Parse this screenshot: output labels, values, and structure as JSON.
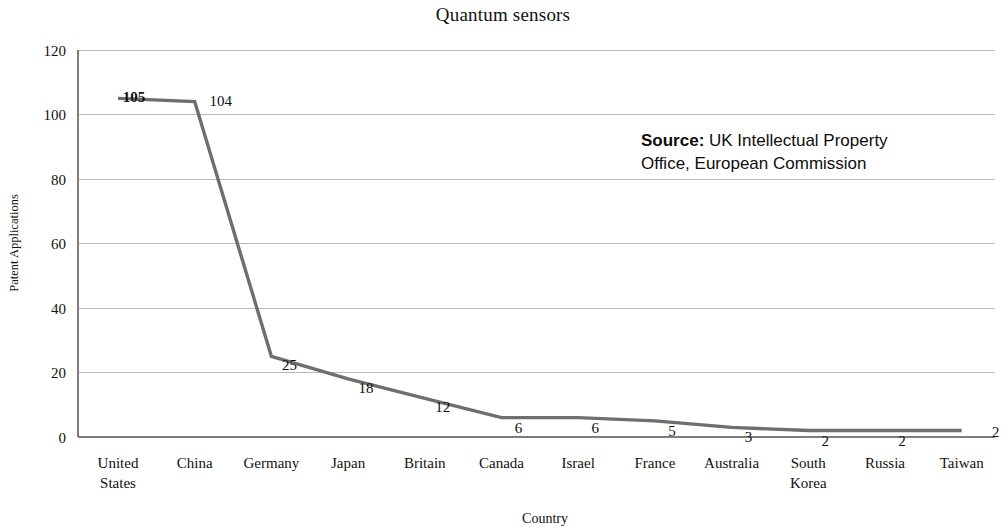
{
  "chart_data": {
    "type": "line",
    "title": "Quantum sensors",
    "xlabel": "Country",
    "ylabel": "Patent Applications",
    "categories": [
      "United States",
      "China",
      "Germany",
      "Japan",
      "Britain",
      "Canada",
      "Israel",
      "France",
      "Australia",
      "South Korea",
      "Russia",
      "Taiwan"
    ],
    "values": [
      105,
      104,
      25,
      18,
      12,
      6,
      6,
      5,
      3,
      2,
      2,
      2
    ],
    "data_labels": [
      "105",
      "104",
      "25",
      "18",
      "12",
      "6",
      "6",
      "5",
      "3",
      "2",
      "2",
      "2"
    ],
    "ylim": [
      0,
      120
    ],
    "ytick_labels": [
      "0",
      "20",
      "40",
      "60",
      "80",
      "100",
      "120"
    ],
    "yticks": [
      0,
      20,
      40,
      60,
      80,
      100,
      120
    ],
    "grid": true,
    "legend": "none",
    "series_color": "#6e6e6e",
    "gridline_color": "#b9b9b9",
    "axis_color": "#7d7d7d"
  },
  "annotation": {
    "source_label": "Source:",
    "source_line1": " UK Intellectual Property",
    "source_line2": "Office, European Commission"
  }
}
